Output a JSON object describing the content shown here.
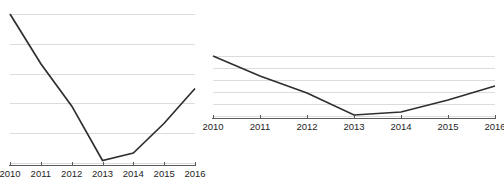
{
  "figure": {
    "name": "aspect-ratio-comparison-figure",
    "background_color": "#ffffff",
    "panel_count": 2
  },
  "style": {
    "line_color": "#2f2f2f",
    "gridline_color": "#dcdcdc",
    "axis_color": "#5a5a5a",
    "label_color": "#1e1e1e"
  },
  "chart_data": [
    {
      "id": "tall",
      "type": "line",
      "title": "",
      "subtitle": "",
      "xlabel": "",
      "ylabel": "",
      "categories": [
        "2010",
        "2011",
        "2012",
        "2013",
        "2014",
        "2015",
        "2016"
      ],
      "x": [
        2010,
        2011,
        2012,
        2013,
        2014,
        2015,
        2016
      ],
      "values": [
        6.0,
        4.0,
        2.3,
        0.1,
        0.4,
        1.6,
        3.0
      ],
      "series": [
        {
          "name": "series-1",
          "values": [
            6.0,
            4.0,
            2.3,
            0.1,
            0.4,
            1.6,
            3.0
          ]
        }
      ],
      "ylim": [
        0,
        6
      ],
      "xlim": [
        2010,
        2016
      ],
      "gridlines": {
        "horizontal": true,
        "vertical": false,
        "y_values": [
          0,
          1.2,
          2.4,
          3.6,
          4.8,
          6.0
        ],
        "count": 6
      },
      "y_tick_labels": [],
      "x_tick_labels": [
        "2010",
        "2011",
        "2012",
        "2013",
        "2014",
        "2015",
        "2016"
      ],
      "legend": null,
      "legend_position": "none",
      "aspect": "tall",
      "annotations": []
    },
    {
      "id": "flat",
      "type": "line",
      "title": "",
      "subtitle": "",
      "xlabel": "",
      "ylabel": "",
      "categories": [
        "2010",
        "2011",
        "2012",
        "2013",
        "2014",
        "2015",
        "2016"
      ],
      "x": [
        2010,
        2011,
        2012,
        2013,
        2014,
        2015,
        2016
      ],
      "values": [
        6.0,
        4.0,
        2.3,
        0.1,
        0.4,
        1.6,
        3.0
      ],
      "series": [
        {
          "name": "series-1",
          "values": [
            6.0,
            4.0,
            2.3,
            0.1,
            0.4,
            1.6,
            3.0
          ]
        }
      ],
      "ylim": [
        0,
        6
      ],
      "xlim": [
        2010,
        2016
      ],
      "gridlines": {
        "horizontal": true,
        "vertical": false,
        "y_values": [
          0,
          1.2,
          2.4,
          3.6,
          4.8,
          6.0
        ],
        "count": 6
      },
      "y_tick_labels": [],
      "x_tick_labels": [
        "2010",
        "2011",
        "2012",
        "2013",
        "2014",
        "2015",
        "2016"
      ],
      "legend": null,
      "legend_position": "none",
      "aspect": "compressed",
      "annotations": []
    }
  ]
}
